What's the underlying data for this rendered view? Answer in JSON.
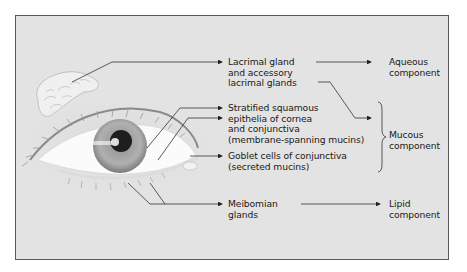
{
  "diagram": {
    "type": "anatomical-flow",
    "sources": [
      {
        "id": "lacrimal",
        "lines": [
          "Lacrimal gland",
          "and accessory",
          "lacrimal glands"
        ]
      },
      {
        "id": "epithelia",
        "lines": [
          "Stratified squamous",
          "epithelia of cornea",
          "and conjunctiva",
          "(membrane-spanning mucins)"
        ]
      },
      {
        "id": "goblet",
        "lines": [
          "Goblet cells of conjunctiva",
          "(secreted mucins)"
        ]
      },
      {
        "id": "meibomian",
        "lines": [
          "Meibomian",
          "glands"
        ]
      }
    ],
    "components": [
      {
        "id": "aqueous",
        "lines": [
          "Aqueous",
          "component"
        ]
      },
      {
        "id": "mucous",
        "lines": [
          "Mucous",
          "component"
        ]
      },
      {
        "id": "lipid",
        "lines": [
          "Lipid",
          "component"
        ]
      }
    ],
    "edges": [
      [
        "lacrimal",
        "aqueous"
      ],
      [
        "lacrimal",
        "mucous"
      ],
      [
        "epithelia",
        "mucous"
      ],
      [
        "goblet",
        "mucous"
      ],
      [
        "meibomian",
        "lipid"
      ]
    ]
  }
}
